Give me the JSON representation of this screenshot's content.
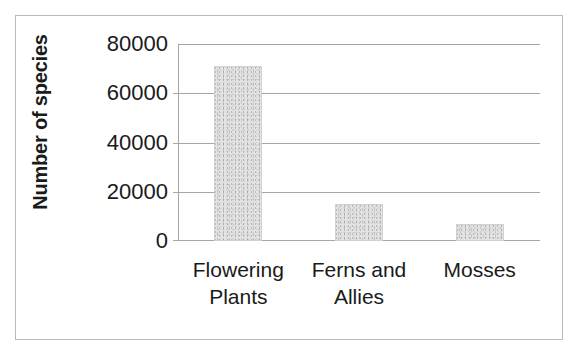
{
  "chart_data": {
    "type": "bar",
    "title": "",
    "subtitle": "",
    "xlabel": "",
    "ylabel": "Number of species",
    "categories": [
      "Flowering Plants",
      "Ferns and Allies",
      "Mosses"
    ],
    "category_lines": [
      [
        "Flowering",
        "Plants"
      ],
      [
        "Ferns and",
        "Allies"
      ],
      [
        "Mosses"
      ]
    ],
    "values": [
      71000,
      15000,
      7000
    ],
    "ylim": [
      0,
      80000
    ],
    "yticks": [
      0,
      20000,
      40000,
      60000,
      80000
    ],
    "ytick_labels": [
      "0",
      "20000",
      "40000",
      "60000",
      "80000"
    ],
    "grid": true,
    "grid_axis": "y",
    "legend": false,
    "legend_position": "none",
    "bar_fill_color": "#e3e3e3",
    "grid_color": "#a6a6a6",
    "axis_color": "#a6a6a6",
    "text_color": "#1a1a1a",
    "frame_color": "#b9b9b9"
  }
}
